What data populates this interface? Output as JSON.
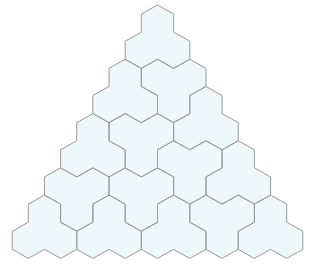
{
  "colors": {
    "background": "#ffffff",
    "tile_fill": "#eef8fa",
    "edge_stroke": "#9a9a9a"
  },
  "geometry": {
    "rows": 9,
    "top_center_x": 157.5,
    "top_center_y": 23.1,
    "hex_width": 32.3,
    "hex_half_height": 18.1,
    "row_spacing": 27.15,
    "stroke_width": 1
  },
  "tiles": [
    {
      "id": "A",
      "orientation": "up",
      "cells": [
        [
          0,
          0
        ],
        [
          1,
          0
        ],
        [
          1,
          1
        ]
      ]
    },
    {
      "id": "B",
      "orientation": "down",
      "cells": [
        [
          2,
          1
        ],
        [
          2,
          2
        ],
        [
          3,
          2
        ]
      ]
    },
    {
      "id": "C",
      "orientation": "up",
      "cells": [
        [
          2,
          0
        ],
        [
          3,
          0
        ],
        [
          3,
          1
        ]
      ]
    },
    {
      "id": "D",
      "orientation": "up",
      "cells": [
        [
          3,
          3
        ],
        [
          4,
          3
        ],
        [
          4,
          4
        ]
      ]
    },
    {
      "id": "E",
      "orientation": "up",
      "cells": [
        [
          5,
          5
        ],
        [
          6,
          5
        ],
        [
          6,
          6
        ]
      ]
    },
    {
      "id": "F",
      "orientation": "up",
      "cells": [
        [
          7,
          7
        ],
        [
          8,
          7
        ],
        [
          8,
          8
        ]
      ]
    },
    {
      "id": "G",
      "orientation": "up",
      "cells": [
        [
          4,
          0
        ],
        [
          5,
          0
        ],
        [
          5,
          1
        ]
      ]
    },
    {
      "id": "H",
      "orientation": "down",
      "cells": [
        [
          4,
          1
        ],
        [
          4,
          2
        ],
        [
          5,
          2
        ]
      ]
    },
    {
      "id": "I",
      "orientation": "down",
      "cells": [
        [
          5,
          3
        ],
        [
          5,
          4
        ],
        [
          6,
          4
        ]
      ]
    },
    {
      "id": "J",
      "orientation": "down",
      "cells": [
        [
          6,
          0
        ],
        [
          6,
          1
        ],
        [
          7,
          1
        ]
      ]
    },
    {
      "id": "K",
      "orientation": "up",
      "cells": [
        [
          7,
          0
        ],
        [
          8,
          0
        ],
        [
          8,
          1
        ]
      ]
    },
    {
      "id": "L",
      "orientation": "down",
      "cells": [
        [
          6,
          2
        ],
        [
          6,
          3
        ],
        [
          7,
          3
        ]
      ]
    },
    {
      "id": "M",
      "orientation": "up",
      "cells": [
        [
          7,
          2
        ],
        [
          8,
          2
        ],
        [
          8,
          3
        ]
      ]
    },
    {
      "id": "N",
      "orientation": "up",
      "cells": [
        [
          7,
          4
        ],
        [
          8,
          4
        ],
        [
          8,
          5
        ]
      ]
    },
    {
      "id": "O",
      "orientation": "down",
      "cells": [
        [
          7,
          5
        ],
        [
          7,
          6
        ],
        [
          8,
          6
        ]
      ]
    }
  ]
}
